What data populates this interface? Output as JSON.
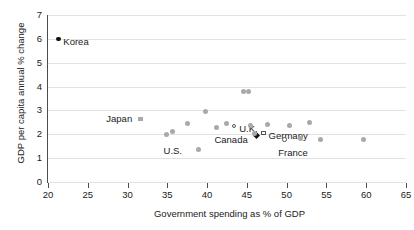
{
  "chart_data": {
    "type": "scatter",
    "title": "",
    "xlabel": "Government spending as % of GDP",
    "ylabel": "GDP per capita annual % change",
    "xlim": [
      20,
      65
    ],
    "ylim": [
      0,
      7
    ],
    "xticks": [
      20,
      25,
      30,
      35,
      40,
      45,
      50,
      55,
      60,
      65
    ],
    "yticks": [
      0,
      1,
      2,
      3,
      4,
      5,
      6,
      7
    ],
    "grid": "horizontal",
    "legend": "none",
    "points": [
      {
        "label": "Korea",
        "x": 21.3,
        "y": 6.0,
        "marker": "dot-dark",
        "labelled": true,
        "label_dx": 5,
        "label_dy": 3
      },
      {
        "label": "Japan",
        "x": 31.6,
        "y": 2.65,
        "marker": "square",
        "labelled": true,
        "label_dx": -34,
        "label_dy": 0
      },
      {
        "label": "U.S.",
        "x": 34.9,
        "y": 1.98,
        "marker": "dot",
        "labelled": true,
        "label_dx": -3,
        "label_dy": 16
      },
      {
        "label": "U.K.",
        "x": 43.4,
        "y": 2.35,
        "marker": "circle-open",
        "labelled": true,
        "label_dx": 5,
        "label_dy": 3
      },
      {
        "label": "Canada",
        "x": 46.2,
        "y": 1.93,
        "marker": "diamond",
        "labelled": true,
        "label_dx": -42,
        "label_dy": 4
      },
      {
        "label": "Germany",
        "x": 47.1,
        "y": 2.05,
        "marker": "square-open",
        "labelled": true,
        "label_dx": 5,
        "label_dy": 3
      },
      {
        "label": "France",
        "x": 49.7,
        "y": 1.78,
        "marker": "circle-open",
        "labelled": true,
        "label_dx": -6,
        "label_dy": 13
      },
      {
        "label": "",
        "x": 35.7,
        "y": 2.12,
        "marker": "dot",
        "labelled": false
      },
      {
        "label": "",
        "x": 37.5,
        "y": 2.45,
        "marker": "dot",
        "labelled": false
      },
      {
        "label": "",
        "x": 38.9,
        "y": 1.35,
        "marker": "dot",
        "labelled": false
      },
      {
        "label": "",
        "x": 39.8,
        "y": 2.97,
        "marker": "dot",
        "labelled": false
      },
      {
        "label": "",
        "x": 41.2,
        "y": 2.28,
        "marker": "dot",
        "labelled": false
      },
      {
        "label": "",
        "x": 42.4,
        "y": 2.45,
        "marker": "dot",
        "labelled": false
      },
      {
        "label": "",
        "x": 44.6,
        "y": 3.78,
        "marker": "dot",
        "labelled": false
      },
      {
        "label": "",
        "x": 45.2,
        "y": 3.8,
        "marker": "dot",
        "labelled": false
      },
      {
        "label": "",
        "x": 45.4,
        "y": 2.38,
        "marker": "dot",
        "labelled": false
      },
      {
        "label": "",
        "x": 46.0,
        "y": 2.02,
        "marker": "dot",
        "labelled": false
      },
      {
        "label": "",
        "x": 47.6,
        "y": 2.42,
        "marker": "dot",
        "labelled": false
      },
      {
        "label": "",
        "x": 50.3,
        "y": 2.35,
        "marker": "dot",
        "labelled": false
      },
      {
        "label": "",
        "x": 51.7,
        "y": 1.82,
        "marker": "dot",
        "labelled": false
      },
      {
        "label": "",
        "x": 52.9,
        "y": 2.48,
        "marker": "dot",
        "labelled": false
      },
      {
        "label": "",
        "x": 54.3,
        "y": 1.8,
        "marker": "dot",
        "labelled": false
      },
      {
        "label": "",
        "x": 59.6,
        "y": 1.78,
        "marker": "dot",
        "labelled": false
      }
    ]
  }
}
